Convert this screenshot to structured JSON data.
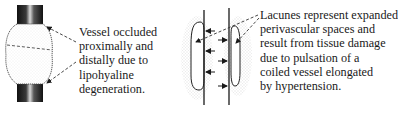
{
  "panels": [
    {
      "id": "occluded-vessel",
      "caption_lines": [
        "Vessel occluded",
        "proximally and",
        "distally due to",
        "lipohyaline",
        "degeneration."
      ]
    },
    {
      "id": "lacunes",
      "caption_lines": [
        "Lacunes represent expanded",
        "perivascular spaces and",
        "result from tissue damage",
        "due to pulsation of a",
        "coiled vessel elongated",
        "by hypertension."
      ]
    }
  ],
  "colors": {
    "ink": "#1a1a1a",
    "vessel_dark": "#2a2a2a",
    "stipple": "#bdbdbd",
    "background": "#ffffff"
  }
}
